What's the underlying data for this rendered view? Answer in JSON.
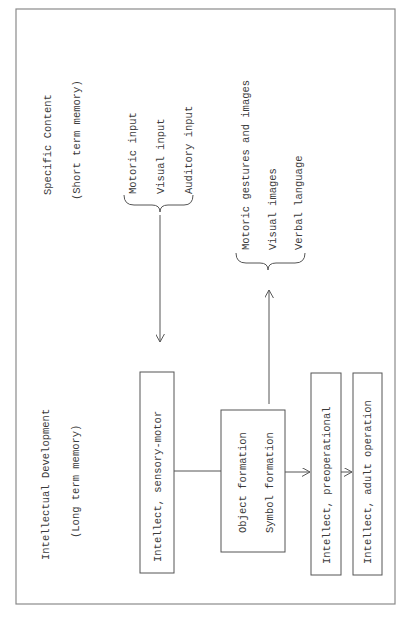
{
  "diagram": {
    "left_header": {
      "title": "Specific Content",
      "subtitle": "(Short term memory)"
    },
    "input_group": {
      "items": [
        "Motoric input",
        "Visual input",
        "Auditory input"
      ]
    },
    "output_group": {
      "items": [
        "Motoric gestures and images",
        "Visual images",
        "Verbal language"
      ]
    },
    "bottom_header": {
      "title": "Intellectual Development",
      "subtitle": "(Long term memory)"
    },
    "boxes": {
      "sensory_motor": "Intellect, sensory-motor",
      "formation_line1": "Object formation",
      "formation_line2": "Symbol formation",
      "preoperational": "Intellect, preoperational",
      "adult_operation": "Intellect, adult operation"
    },
    "colors": {
      "ink": "#3a3a3a",
      "frame": "#8a8a8a",
      "background": "#ffffff"
    }
  }
}
